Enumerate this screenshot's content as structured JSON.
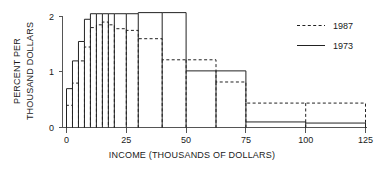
{
  "chart_data": {
    "type": "bar",
    "title": "",
    "subtitle": "",
    "xlabel": "INCOME (THOUSANDS OF DOLLARS)",
    "ylabel_line1": "PERCENT PER",
    "ylabel_line2": "THOUSAND DOLLARS",
    "xlim": [
      0,
      125
    ],
    "ylim": [
      0,
      2
    ],
    "xticks": [
      0,
      25,
      50,
      75,
      100,
      125
    ],
    "xtick_labels": [
      "0",
      "25",
      "50",
      "75",
      "100",
      "125"
    ],
    "yticks": [
      0,
      1,
      2
    ],
    "ytick_labels": [
      "0",
      "1",
      "2"
    ],
    "grid": false,
    "legend_position": "top-right",
    "legend": [
      {
        "name": "1987",
        "style": "dashed"
      },
      {
        "name": "1973",
        "style": "solid"
      }
    ],
    "bin_edges": [
      0,
      2.5,
      5,
      7.5,
      10,
      12.5,
      15,
      17.5,
      20,
      25,
      30,
      40,
      50,
      62.5,
      75,
      100,
      125
    ],
    "series": [
      {
        "name": "1973",
        "style": "solid",
        "values": [
          0.7,
          1.2,
          1.55,
          1.95,
          2.05,
          2.05,
          2.05,
          2.05,
          2.05,
          2.05,
          2.07,
          2.07,
          1.02,
          1.02,
          0.1,
          0.08
        ]
      },
      {
        "name": "1987",
        "style": "dashed",
        "values": [
          0.4,
          0.8,
          1.2,
          1.45,
          1.8,
          1.85,
          1.9,
          1.85,
          1.78,
          1.75,
          1.6,
          1.22,
          1.22,
          0.82,
          0.44,
          0.44
        ]
      }
    ]
  },
  "axes": {
    "x_axis_name": "income-axis",
    "y_axis_name": "percent-axis"
  }
}
